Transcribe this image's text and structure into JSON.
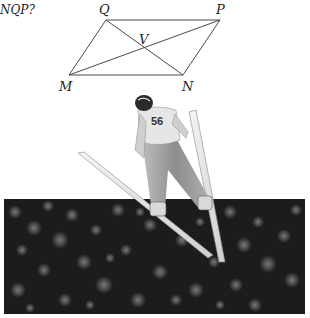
{
  "question": {
    "text_fragment": "NQP?"
  },
  "diagram": {
    "shape": "parallelogram",
    "vertices": [
      {
        "name": "Q",
        "x": 106,
        "y": 20
      },
      {
        "name": "P",
        "x": 220,
        "y": 20
      },
      {
        "name": "N",
        "x": 183,
        "y": 75
      },
      {
        "name": "M",
        "x": 69,
        "y": 75
      }
    ],
    "intersection": {
      "name": "V",
      "x": 144,
      "y": 48
    },
    "labels": {
      "Q": "Q",
      "P": "P",
      "M": "M",
      "N": "N",
      "V": "V"
    },
    "line_color": "#4a4a4a"
  },
  "photo": {
    "subject": "ski jumper in flight",
    "bib_number": "56",
    "background": "blurred crowd"
  }
}
